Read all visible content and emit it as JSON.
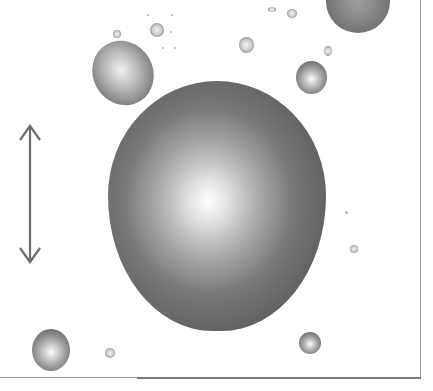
{
  "image": {
    "description": "Grayscale micrograph-style image of droplets/spheres with a vertical double-headed scale arrow",
    "background_color": "#ffffff",
    "arrow": {
      "orientation": "vertical",
      "type": "double-headed",
      "color": "#707070"
    },
    "objects": [
      {
        "name": "large-central-sphere",
        "shape": "circle",
        "cx": 218,
        "cy": 205,
        "r": 110
      },
      {
        "name": "ellipsoid-droplet-top-left",
        "shape": "ellipse",
        "cx": 122,
        "cy": 72
      },
      {
        "name": "partial-sphere-top-right",
        "shape": "circle",
        "cx": 357,
        "cy": 8
      },
      {
        "name": "sphere-right",
        "shape": "circle",
        "cx": 311,
        "cy": 77
      },
      {
        "name": "sphere-bottom-left",
        "shape": "circle",
        "cx": 51,
        "cy": 349
      },
      {
        "name": "sphere-bottom-right",
        "shape": "circle",
        "cx": 310,
        "cy": 343
      },
      {
        "name": "small-droplet-1",
        "cx": 157,
        "cy": 30
      },
      {
        "name": "small-droplet-2",
        "cx": 246,
        "cy": 45
      },
      {
        "name": "small-droplet-3",
        "cx": 292,
        "cy": 14
      },
      {
        "name": "small-droplet-4",
        "cx": 328,
        "cy": 51
      },
      {
        "name": "small-droplet-5",
        "cx": 117,
        "cy": 34
      },
      {
        "name": "small-droplet-6",
        "cx": 110,
        "cy": 353
      },
      {
        "name": "small-droplet-7",
        "cx": 354,
        "cy": 249
      },
      {
        "name": "tiny-dot-1",
        "cx": 346,
        "cy": 212
      }
    ]
  }
}
